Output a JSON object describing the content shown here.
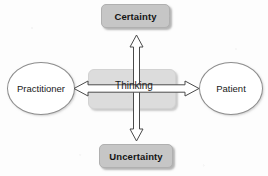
{
  "diagram": {
    "type": "cross-axis-concept-diagram",
    "background_color": "#fdfdfd",
    "nodes": {
      "top": {
        "label": "Certainty",
        "shape": "rounded-rectangle",
        "fill": "#c6c6c6",
        "text_color": "#141414",
        "bold": true
      },
      "bottom": {
        "label": "Uncertainty",
        "shape": "rounded-rectangle",
        "fill": "#c6c6c6",
        "text_color": "#141414",
        "bold": true
      },
      "left": {
        "label": "Practitioner",
        "shape": "ellipse",
        "fill": "#ffffff",
        "border_color": "#8d8d8d",
        "text_color": "#191919"
      },
      "right": {
        "label": "Patient",
        "shape": "ellipse",
        "fill": "#ffffff",
        "border_color": "#8d8d8d",
        "text_color": "#191919"
      },
      "center": {
        "label": "Thinking",
        "shape": "rounded-rectangle",
        "fill": "#dcdcdc",
        "text_color": "#1d1d1d",
        "bold": false
      }
    },
    "connectors": [
      {
        "name": "vertical-axis",
        "from": "Uncertainty",
        "to": "Certainty",
        "style": "double-headed-block-arrow",
        "fill": "#ffffff",
        "stroke": "#4a4a4a"
      },
      {
        "name": "horizontal-axis",
        "from": "Practitioner",
        "to": "Patient",
        "style": "double-headed-block-arrow",
        "fill": "#ffffff",
        "stroke": "#4a4a4a"
      }
    ]
  }
}
